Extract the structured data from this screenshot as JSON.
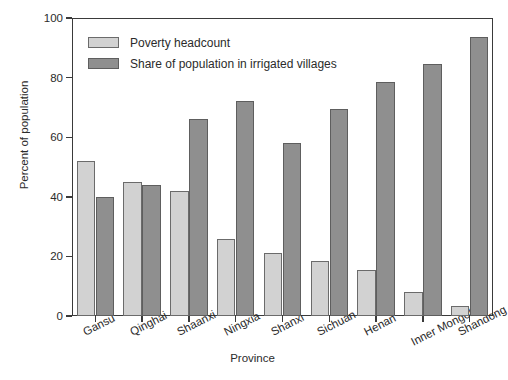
{
  "chart_data": {
    "type": "bar",
    "title": "",
    "xlabel": "Province",
    "ylabel": "Percent of population",
    "ylim": [
      0,
      100
    ],
    "yticks": [
      0,
      20,
      40,
      60,
      80,
      100
    ],
    "grid": false,
    "legend_position": "top-left inside axes",
    "categories": [
      "Gansu",
      "Qinghai",
      "Shaanxi",
      "Ningxia",
      "Shanxi",
      "Sichuan",
      "Henan",
      "Inner Mongolia",
      "Shandong"
    ],
    "series": [
      {
        "name": "Poverty headcount",
        "color": "#d2d2d2",
        "values": [
          52,
          45,
          42,
          26,
          21,
          18.5,
          15.5,
          8,
          3.5
        ]
      },
      {
        "name": "Share of population in irrigated villages",
        "color": "#8f8f8f",
        "values": [
          40,
          44,
          66,
          72,
          58,
          69.5,
          78.5,
          84.5,
          93.5
        ]
      }
    ]
  },
  "axes": {
    "y_title": "Percent of population",
    "x_title": "Province",
    "y_tick_labels": [
      "0",
      "20",
      "40",
      "60",
      "80",
      "100"
    ]
  },
  "legend": {
    "items": [
      {
        "label": "Poverty headcount",
        "swatch": "light-gray-swatch"
      },
      {
        "label": "Share of population in irrigated villages",
        "swatch": "dark-gray-swatch"
      }
    ]
  }
}
